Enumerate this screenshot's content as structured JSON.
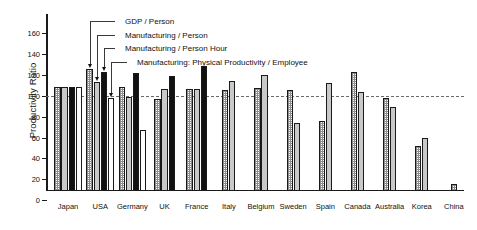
{
  "chart_data": {
    "type": "bar",
    "title": "",
    "xlabel": "",
    "ylabel": "Productivity Ratio",
    "ylim": [
      0,
      170
    ],
    "yticks": [
      0,
      20,
      40,
      60,
      80,
      100,
      120,
      140,
      160
    ],
    "ytick_labels": [
      "0",
      "20",
      "40",
      "60",
      "80",
      "100",
      "120",
      "140",
      "160"
    ],
    "grid": false,
    "reference_line": 100,
    "legend_position": "top-center-callouts",
    "categories": [
      "Japan",
      "USA",
      "Germany",
      "UK",
      "France",
      "Italy",
      "Belgium",
      "Sweden",
      "Spain",
      "Canada",
      "Australia",
      "Korea",
      "China"
    ],
    "series": [
      {
        "name": "GDP / Person",
        "pattern": "checkered",
        "values": [
          100,
          117,
          100,
          88,
          98,
          97,
          99,
          97,
          67,
          114,
          89,
          43,
          7
        ]
      },
      {
        "name": "Manufacturing / Person",
        "pattern": "light-gray",
        "values": [
          100,
          105,
          90,
          98,
          98,
          106,
          111,
          65,
          104,
          95,
          81,
          51,
          null
        ]
      },
      {
        "name": "Manufacturing / Person  Hour",
        "pattern": "black",
        "values": [
          100,
          114,
          113,
          110,
          120,
          null,
          null,
          null,
          null,
          null,
          null,
          null,
          null
        ]
      },
      {
        "name": "Manufacturing: Physical Productivity / Employee",
        "pattern": "white",
        "values": [
          100,
          89,
          59,
          null,
          null,
          null,
          null,
          null,
          null,
          null,
          null,
          null,
          null
        ]
      }
    ]
  },
  "axis": {
    "y_title": "Productivity Ratio"
  },
  "legend": {
    "items": [
      {
        "label": "GDP / Person"
      },
      {
        "label": "Manufacturing / Person"
      },
      {
        "label": "Manufacturing / Person  Hour"
      },
      {
        "label": "Manufacturing: Physical Productivity / Employee"
      }
    ]
  }
}
